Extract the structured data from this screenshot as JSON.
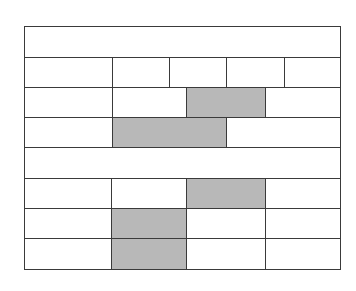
{
  "diagram": {
    "title": "",
    "colors": {
      "line": "#3a3a3a",
      "fill": "#ffffff",
      "shade": "#b8b8b8"
    },
    "rows": [
      {
        "y": 26,
        "h": 31,
        "cells": [
          {
            "x": 24,
            "w": 316,
            "shaded": false
          }
        ]
      },
      {
        "y": 57,
        "h": 30,
        "cells": [
          {
            "x": 24,
            "w": 88,
            "shaded": false
          },
          {
            "x": 112,
            "w": 57,
            "shaded": false
          },
          {
            "x": 169,
            "w": 57,
            "shaded": false
          },
          {
            "x": 226,
            "w": 58,
            "shaded": false
          },
          {
            "x": 284,
            "w": 56,
            "shaded": false
          }
        ]
      },
      {
        "y": 87,
        "h": 30,
        "cells": [
          {
            "x": 24,
            "w": 88,
            "shaded": false
          },
          {
            "x": 112,
            "w": 74,
            "shaded": false
          },
          {
            "x": 186,
            "w": 79,
            "shaded": true
          },
          {
            "x": 265,
            "w": 75,
            "shaded": false
          }
        ]
      },
      {
        "y": 117,
        "h": 30,
        "cells": [
          {
            "x": 24,
            "w": 88,
            "shaded": false
          },
          {
            "x": 112,
            "w": 114,
            "shaded": true
          },
          {
            "x": 226,
            "w": 114,
            "shaded": false
          }
        ]
      },
      {
        "y": 147,
        "h": 31,
        "cells": [
          {
            "x": 24,
            "w": 316,
            "shaded": false
          }
        ]
      },
      {
        "y": 178,
        "h": 30,
        "cells": [
          {
            "x": 24,
            "w": 87,
            "shaded": false
          },
          {
            "x": 111,
            "w": 75,
            "shaded": false
          },
          {
            "x": 186,
            "w": 79,
            "shaded": true
          },
          {
            "x": 265,
            "w": 75,
            "shaded": false
          }
        ]
      },
      {
        "y": 208,
        "h": 30,
        "cells": [
          {
            "x": 24,
            "w": 87,
            "shaded": false
          },
          {
            "x": 111,
            "w": 75,
            "shaded": true
          },
          {
            "x": 186,
            "w": 79,
            "shaded": false
          },
          {
            "x": 265,
            "w": 75,
            "shaded": false
          }
        ]
      },
      {
        "y": 238,
        "h": 31,
        "cells": [
          {
            "x": 24,
            "w": 87,
            "shaded": false
          },
          {
            "x": 111,
            "w": 75,
            "shaded": true
          },
          {
            "x": 186,
            "w": 79,
            "shaded": false
          },
          {
            "x": 265,
            "w": 75,
            "shaded": false
          }
        ]
      }
    ]
  }
}
